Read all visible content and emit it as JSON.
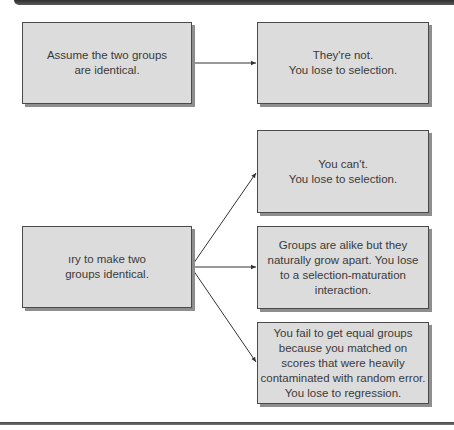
{
  "diagram": {
    "top": {
      "premise": "Assume the two groups are identical.",
      "premise_lines": [
        "Assume the two groups",
        "are identical."
      ],
      "outcome_lines": [
        "They're not.",
        "You lose to selection."
      ]
    },
    "bottom": {
      "premise_lines": [
        "ıry to make two",
        "groups identical."
      ],
      "outcomes": [
        {
          "lines": [
            "You can't.",
            "You lose to selection."
          ]
        },
        {
          "lines": [
            "Groups are alike but they",
            "naturally grow apart. You lose",
            "to a selection-maturation",
            "interaction."
          ]
        },
        {
          "lines": [
            "You fail to get equal groups",
            "because you matched on",
            "scores that were heavily",
            "contaminated with random error.",
            "You lose to regression."
          ]
        }
      ]
    },
    "colors": {
      "box_fill": "#dcdcdc",
      "box_border": "#4a4a4a",
      "shadow": "#8e8e8e",
      "arrow": "#333333"
    }
  }
}
